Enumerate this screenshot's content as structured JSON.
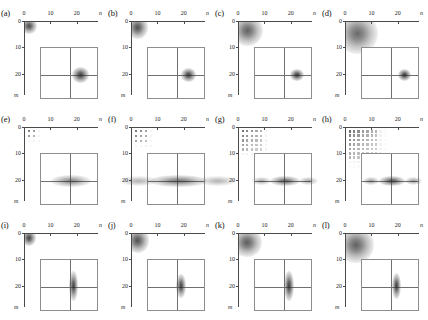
{
  "figure": {
    "type": "multi-panel-density-grid",
    "rows": 3,
    "cols": 4,
    "panel_count": 12
  },
  "axes": {
    "x_name": "n",
    "y_name": "m",
    "x_ticks": [
      "0",
      "10",
      "20"
    ],
    "y_ticks": [
      "0",
      "10",
      "20"
    ],
    "x_tick_values": [
      0,
      10,
      20
    ],
    "y_tick_values": [
      0,
      10,
      20
    ],
    "x_range": [
      0,
      28
    ],
    "y_range": [
      0,
      28
    ],
    "origin": "top-left"
  },
  "colors": {
    "ink": "#1a1a1a",
    "axis": "#4a4a4a",
    "inset_border": "#8d8d8d",
    "inset_cross": "#6f6f6f",
    "density": "#3a3a3a",
    "background": "#ffffff"
  },
  "chart_data": {
    "type": "heatmap",
    "title": "",
    "xlabel": "n",
    "ylabel": "m",
    "panels": [
      {
        "label": "(a)",
        "row": 1,
        "col": 1,
        "main": {
          "kind": "gaussian-blob",
          "center_n": 1.6,
          "center_m": 1.6,
          "sigma_n": 1.9,
          "sigma_m": 1.9,
          "peak_opacity": 0.82
        },
        "inset": {
          "kind": "point",
          "cx_frac": 0.68,
          "cy_frac": 0.52,
          "width_frac": 0.16,
          "height_frac": 0.16,
          "peak_opacity": 0.88
        }
      },
      {
        "label": "(b)",
        "row": 1,
        "col": 2,
        "main": {
          "kind": "gaussian-blob",
          "center_n": 2.0,
          "center_m": 2.2,
          "sigma_n": 2.6,
          "sigma_m": 2.8,
          "peak_opacity": 0.8
        },
        "inset": {
          "kind": "point",
          "cx_frac": 0.7,
          "cy_frac": 0.52,
          "width_frac": 0.14,
          "height_frac": 0.14,
          "peak_opacity": 0.88
        }
      },
      {
        "label": "(c)",
        "row": 1,
        "col": 3,
        "main": {
          "kind": "gaussian-blob",
          "center_n": 3.2,
          "center_m": 3.2,
          "sigma_n": 3.8,
          "sigma_m": 3.8,
          "peak_opacity": 0.72
        },
        "inset": {
          "kind": "point",
          "cx_frac": 0.72,
          "cy_frac": 0.52,
          "width_frac": 0.13,
          "height_frac": 0.13,
          "peak_opacity": 0.9
        }
      },
      {
        "label": "(d)",
        "row": 1,
        "col": 4,
        "main": {
          "kind": "gaussian-blob",
          "center_n": 4.2,
          "center_m": 4.4,
          "sigma_n": 5.0,
          "sigma_m": 5.0,
          "peak_opacity": 0.68
        },
        "inset": {
          "kind": "point",
          "cx_frac": 0.73,
          "cy_frac": 0.52,
          "width_frac": 0.12,
          "height_frac": 0.12,
          "peak_opacity": 0.9
        }
      },
      {
        "label": "(e)",
        "row": 2,
        "col": 1,
        "main": {
          "kind": "lattice",
          "grid_n": 2,
          "grid_m": 2,
          "spacing_px": 5.0,
          "dot_px": 2.2,
          "decay": 0.52,
          "peak_opacity": 0.62
        },
        "inset": {
          "kind": "horizontal-ellipse",
          "cx_frac": 0.52,
          "cy_frac": 0.52,
          "width_frac": 0.4,
          "height_frac": 0.11,
          "peak_opacity": 0.55,
          "satellites": 0
        }
      },
      {
        "label": "(f)",
        "row": 2,
        "col": 2,
        "main": {
          "kind": "lattice",
          "grid_n": 3,
          "grid_m": 3,
          "spacing_px": 5.0,
          "dot_px": 2.4,
          "decay": 0.6,
          "peak_opacity": 0.7
        },
        "inset": {
          "kind": "horizontal-ellipse",
          "cx_frac": 0.52,
          "cy_frac": 0.52,
          "width_frac": 0.58,
          "height_frac": 0.1,
          "peak_opacity": 0.62,
          "satellites": 2
        }
      },
      {
        "label": "(g)",
        "row": 2,
        "col": 3,
        "main": {
          "kind": "lattice",
          "grid_n": 5,
          "grid_m": 5,
          "spacing_px": 4.6,
          "dot_px": 2.4,
          "decay": 0.68,
          "peak_opacity": 0.72
        },
        "inset": {
          "kind": "horizontal-ellipse",
          "cx_frac": 0.52,
          "cy_frac": 0.52,
          "width_frac": 0.3,
          "height_frac": 0.09,
          "peak_opacity": 0.7,
          "satellites": 2
        }
      },
      {
        "label": "(h)",
        "row": 2,
        "col": 4,
        "main": {
          "kind": "lattice",
          "grid_n": 7,
          "grid_m": 7,
          "spacing_px": 4.4,
          "dot_px": 2.5,
          "decay": 0.74,
          "peak_opacity": 0.74
        },
        "inset": {
          "kind": "horizontal-ellipse",
          "cx_frac": 0.52,
          "cy_frac": 0.52,
          "width_frac": 0.26,
          "height_frac": 0.085,
          "peak_opacity": 0.78,
          "satellites": 2
        }
      },
      {
        "label": "(i)",
        "row": 3,
        "col": 1,
        "main": {
          "kind": "gaussian-blob",
          "center_n": 1.5,
          "center_m": 1.5,
          "sigma_n": 1.8,
          "sigma_m": 2.0,
          "peak_opacity": 0.86
        },
        "inset": {
          "kind": "vertical-ellipse",
          "cx_frac": 0.56,
          "cy_frac": 0.5,
          "width_frac": 0.065,
          "height_frac": 0.34,
          "peak_opacity": 0.86
        }
      },
      {
        "label": "(j)",
        "row": 3,
        "col": 2,
        "main": {
          "kind": "gaussian-blob",
          "center_n": 2.2,
          "center_m": 2.4,
          "sigma_n": 2.8,
          "sigma_m": 3.0,
          "peak_opacity": 0.8
        },
        "inset": {
          "kind": "vertical-ellipse",
          "cx_frac": 0.57,
          "cy_frac": 0.5,
          "width_frac": 0.075,
          "height_frac": 0.28,
          "peak_opacity": 0.86
        }
      },
      {
        "label": "(k)",
        "row": 3,
        "col": 3,
        "main": {
          "kind": "gaussian-blob",
          "center_n": 3.0,
          "center_m": 3.2,
          "sigma_n": 3.6,
          "sigma_m": 3.6,
          "peak_opacity": 0.74
        },
        "inset": {
          "kind": "vertical-ellipse",
          "cx_frac": 0.59,
          "cy_frac": 0.5,
          "width_frac": 0.075,
          "height_frac": 0.33,
          "peak_opacity": 0.88
        }
      },
      {
        "label": "(l)",
        "row": 3,
        "col": 4,
        "main": {
          "kind": "gaussian-blob",
          "center_n": 3.8,
          "center_m": 4.0,
          "sigma_n": 4.4,
          "sigma_m": 4.4,
          "peak_opacity": 0.72
        },
        "inset": {
          "kind": "vertical-ellipse",
          "cx_frac": 0.6,
          "cy_frac": 0.5,
          "width_frac": 0.07,
          "height_frac": 0.3,
          "peak_opacity": 0.88
        }
      }
    ]
  }
}
